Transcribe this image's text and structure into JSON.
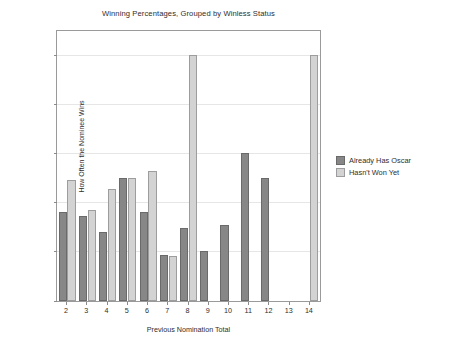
{
  "chart_data": {
    "type": "bar",
    "title": "Winning Percentages, Grouped by Winless Status",
    "xlabel": "Previous Nomination Total",
    "ylabel": "How Often the Nominee Wins",
    "categories": [
      "2",
      "3",
      "4",
      "5",
      "6",
      "7",
      "8",
      "9",
      "10",
      "11",
      "12",
      "13",
      "14"
    ],
    "series": [
      {
        "name": "Already Has Oscar",
        "color": "#878787",
        "values": [
          18.2,
          17.3,
          14.0,
          25.1,
          18.2,
          9.4,
          14.8,
          10.1,
          15.5,
          30.2,
          25.1,
          null,
          null
        ]
      },
      {
        "name": "Hasn't Won Yet",
        "color": "#d3d3d3",
        "values": [
          24.6,
          18.5,
          22.9,
          25.1,
          26.4,
          9.2,
          50.2,
          null,
          null,
          null,
          null,
          null,
          50.2
        ]
      }
    ],
    "ylim": [
      0,
      55
    ],
    "yticks": [
      0,
      10,
      20,
      30,
      40,
      50
    ],
    "ytick_labels": [
      "0%",
      "10%",
      "20%",
      "30%",
      "40%",
      "50%"
    ],
    "grid": true,
    "legend_position": "right"
  },
  "legend": {
    "entries": [
      {
        "label": "Already Has Oscar"
      },
      {
        "label": "Hasn't Won Yet"
      }
    ]
  }
}
